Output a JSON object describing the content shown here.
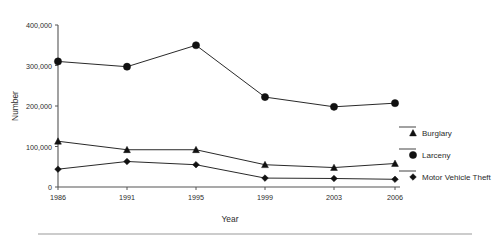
{
  "chart_data": {
    "type": "line",
    "title": "",
    "xlabel": "Year",
    "ylabel": "Number",
    "categories": [
      "1986",
      "1991",
      "1995",
      "1999",
      "2003",
      "2006"
    ],
    "x": [
      1986,
      1991,
      1995,
      1999,
      2003,
      2006
    ],
    "ylim": [
      0,
      400000
    ],
    "yticks": [
      0,
      100000,
      200000,
      300000,
      400000
    ],
    "ytick_labels": [
      "0",
      "100,000",
      "200,000",
      "300,000",
      "400,000"
    ],
    "xtick_labels": [
      "1986",
      "1991",
      "1995",
      "1999",
      "2003",
      "2006"
    ],
    "grid": false,
    "legend_position": "right",
    "series": [
      {
        "name": "Burglary",
        "marker": "triangle",
        "values": [
          113000,
          92000,
          92000,
          55000,
          48000,
          58000
        ]
      },
      {
        "name": "Larceny",
        "marker": "circle",
        "values": [
          310000,
          297000,
          350000,
          222000,
          198000,
          207000
        ]
      },
      {
        "name": "Motor Vehicle Theft",
        "marker": "diamond",
        "values": [
          44000,
          63000,
          55000,
          22000,
          21000,
          19000
        ]
      }
    ],
    "colors": {
      "line": "#111111",
      "marker": "#111111",
      "axis": "#555555",
      "text": "#2b2b2b",
      "rule": "#9a9a9a",
      "background": "#ffffff"
    }
  },
  "axes": {
    "y_label": "Number",
    "x_label": "Year"
  },
  "legend": {
    "items": [
      {
        "label": "Burglary",
        "marker": "triangle"
      },
      {
        "label": "Larceny",
        "marker": "circle"
      },
      {
        "label": "Motor Vehicle Theft",
        "marker": "diamond"
      }
    ]
  }
}
